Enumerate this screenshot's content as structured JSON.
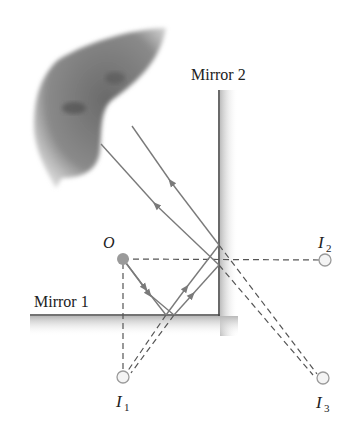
{
  "figure": {
    "labels": {
      "mirror1": "Mirror 1",
      "mirror2": "Mirror 2",
      "object": "O",
      "image1": "I",
      "image1_sub": "1",
      "image2": "I",
      "image2_sub": "2",
      "image3": "I",
      "image3_sub": "3"
    },
    "colors": {
      "ray": "#7a7a7a",
      "mirror": "#444444",
      "dashed": "#555555",
      "object": "#9a9a9a",
      "image_fill": "#f4f4f4",
      "image_stroke": "#9a9a9a"
    },
    "points": {
      "object": [
        123,
        259
      ],
      "image1": [
        123,
        377
      ],
      "image2": [
        325,
        260
      ],
      "image3": [
        323,
        378
      ]
    }
  }
}
